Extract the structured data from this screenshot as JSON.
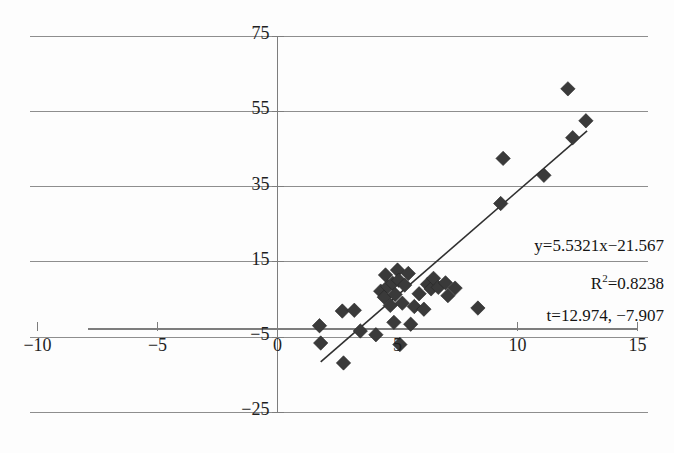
{
  "title": "",
  "chart_data": {
    "type": "scatter",
    "title": "",
    "xlabel": "",
    "ylabel": "",
    "xlim": [
      -10,
      15
    ],
    "ylim": [
      -25,
      75
    ],
    "xticks": [
      -10,
      -5,
      0,
      5,
      10,
      15
    ],
    "yticks": [
      -25,
      -5,
      15,
      35,
      55,
      75
    ],
    "grid": true,
    "legend": false,
    "marker": "diamond",
    "marker_color": "#3a3a3a",
    "trendline": {
      "slope": 5.5321,
      "intercept": -21.567,
      "x_start": 1.8,
      "x_end": 12.9,
      "color": "#303030"
    },
    "annotations": [
      "y=5.5321x−21.567",
      "R²=0.8238",
      "t=12.974, −7.907"
    ],
    "points": [
      {
        "x": 1.75,
        "y": -2.0
      },
      {
        "x": 1.8,
        "y": -6.6
      },
      {
        "x": 2.7,
        "y": 1.9
      },
      {
        "x": 2.75,
        "y": -11.9
      },
      {
        "x": 3.2,
        "y": 2.1
      },
      {
        "x": 3.45,
        "y": -3.4
      },
      {
        "x": 4.1,
        "y": -4.4
      },
      {
        "x": 4.3,
        "y": 7.2
      },
      {
        "x": 4.45,
        "y": 5.6
      },
      {
        "x": 4.5,
        "y": 11.5
      },
      {
        "x": 4.6,
        "y": 8.4
      },
      {
        "x": 4.7,
        "y": 3.4
      },
      {
        "x": 4.8,
        "y": 9.3
      },
      {
        "x": 4.85,
        "y": -1.1
      },
      {
        "x": 4.9,
        "y": 6.3
      },
      {
        "x": 5.0,
        "y": 12.8
      },
      {
        "x": 5.05,
        "y": 10.1
      },
      {
        "x": 5.1,
        "y": -7.0
      },
      {
        "x": 5.2,
        "y": 4.0
      },
      {
        "x": 5.3,
        "y": 8.8
      },
      {
        "x": 5.45,
        "y": 11.9
      },
      {
        "x": 5.55,
        "y": -1.6
      },
      {
        "x": 5.7,
        "y": 3.1
      },
      {
        "x": 5.9,
        "y": 6.5
      },
      {
        "x": 6.1,
        "y": 2.4
      },
      {
        "x": 6.25,
        "y": 9.0
      },
      {
        "x": 6.4,
        "y": 7.8
      },
      {
        "x": 6.5,
        "y": 10.6
      },
      {
        "x": 6.7,
        "y": 8.2
      },
      {
        "x": 7.0,
        "y": 9.4
      },
      {
        "x": 7.1,
        "y": 6.0
      },
      {
        "x": 7.4,
        "y": 8.0
      },
      {
        "x": 8.35,
        "y": 2.7
      },
      {
        "x": 9.3,
        "y": 30.5
      },
      {
        "x": 9.4,
        "y": 42.5
      },
      {
        "x": 11.1,
        "y": 38.0
      },
      {
        "x": 12.1,
        "y": 61.0
      },
      {
        "x": 12.3,
        "y": 48.0
      },
      {
        "x": 12.85,
        "y": 52.5
      }
    ]
  },
  "axis_labels": {
    "x": [
      {
        "value": -10,
        "text": "−10"
      },
      {
        "value": -5,
        "text": "−5"
      },
      {
        "value": 0,
        "text": "0"
      },
      {
        "value": 5,
        "text": "5"
      },
      {
        "value": 10,
        "text": "10"
      },
      {
        "value": 15,
        "text": "15"
      }
    ],
    "y": [
      {
        "value": 75,
        "text": "75"
      },
      {
        "value": 55,
        "text": "55"
      },
      {
        "value": 35,
        "text": "35"
      },
      {
        "value": 15,
        "text": "15"
      },
      {
        "value": -5,
        "text": "−5"
      },
      {
        "value": -25,
        "text": "−25"
      }
    ]
  },
  "annotation_lines": {
    "equation": "y=5.5321x−21.567",
    "r_squared_prefix": "R",
    "r_squared_sup": "2",
    "r_squared_value": "=0.8238",
    "t_values": "t=12.974, −7.907"
  }
}
